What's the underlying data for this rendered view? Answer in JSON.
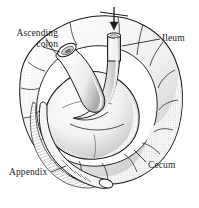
{
  "figure": {
    "style": "grayscale stippled pen-and-ink medical illustration",
    "background_color": "#ffffff",
    "ink_color": "#1c1c1c",
    "shade_color": "#9a9a9a"
  },
  "labels": {
    "ascending_colon": {
      "line1": "Ascending",
      "line2": "colon"
    },
    "ileum": "Ileum",
    "cecum": "Cecum",
    "appendix": "Appendix"
  },
  "annotations": {
    "arrow": {
      "icon": "arrow-down-icon",
      "direction": "down",
      "points_to": "ileum-opening"
    }
  },
  "structures": [
    {
      "name": "cecum",
      "description": "large sac-like pouch forming outer haustrated ring"
    },
    {
      "name": "ileum",
      "description": "vertical cut tube entering cecum from above"
    },
    {
      "name": "ascending-colon",
      "description": "diagonal cut tube at upper left with open oval lumen"
    },
    {
      "name": "appendix",
      "description": "long curved worm-like tube at lower left with hatched mesoappendix"
    }
  ]
}
